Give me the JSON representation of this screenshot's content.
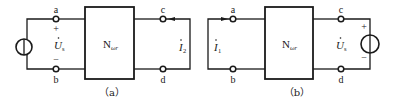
{
  "diagram": {
    "type": "two-port network reciprocity circuits",
    "stroke_color": "#1a1a1a",
    "background": "#ffffff",
    "panels": [
      {
        "id": "a",
        "caption": "（a）",
        "network_label": "N",
        "network_subscript": "ωr",
        "terminals": {
          "top_left": "a",
          "bottom_left": "b",
          "top_right": "c",
          "bottom_right": "d"
        },
        "source": {
          "side": "left",
          "label": "U",
          "subscript": "s",
          "plus": "+",
          "minus": "−"
        },
        "current": {
          "side": "right",
          "label": "I",
          "subscript": "2",
          "arrow_direction": "left"
        }
      },
      {
        "id": "b",
        "caption": "（b）",
        "network_label": "N",
        "network_subscript": "ωr",
        "terminals": {
          "top_left": "a",
          "bottom_left": "b",
          "top_right": "c",
          "bottom_right": "d"
        },
        "source": {
          "side": "right",
          "label": "U",
          "subscript": "s",
          "plus": "+",
          "minus": "−"
        },
        "current": {
          "side": "left",
          "label": "I",
          "subscript": "1",
          "arrow_direction": "right"
        }
      }
    ]
  }
}
